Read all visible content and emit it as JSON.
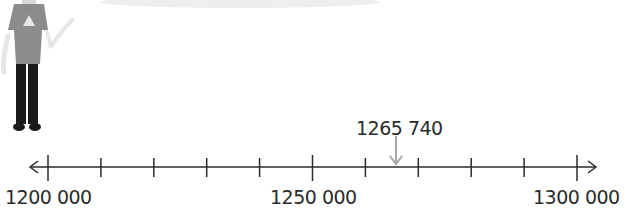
{
  "diagram": {
    "type": "number-line",
    "min": 1200000,
    "max": 1300000,
    "tick_interval": 10000,
    "tick_count": 11,
    "labels": [
      {
        "value": 1200000,
        "text": "1200 000"
      },
      {
        "value": 1250000,
        "text": "1250 000"
      },
      {
        "value": 1300000,
        "text": "1300 000"
      }
    ],
    "marker": {
      "value": 1265740,
      "text": "1265 740",
      "color": "#a8a8a8"
    },
    "line_color": "#2b2b2b",
    "illustration": "person-standing-partial",
    "colors": {
      "shirt": "#8c8c8c",
      "trousers": "#1a1a1a",
      "arms": "#e6e6e6"
    }
  }
}
